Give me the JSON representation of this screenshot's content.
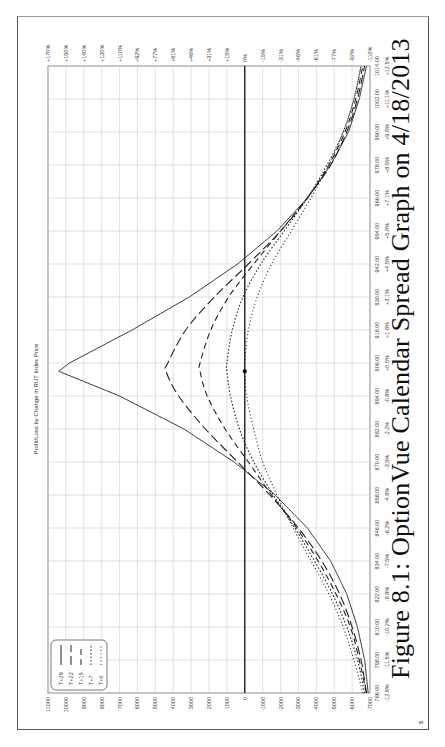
{
  "chart_data": {
    "type": "line",
    "title": "Profit/Loss by Change in RUT Index Price",
    "caption": "Figure 8.1: OptionVue Calendar Spread Graph on 4/18/2013",
    "xlabel": "RUT Index Price",
    "ylabel": "$",
    "x_ticks": [
      786,
      798,
      810,
      822,
      834,
      846,
      858,
      870,
      882,
      894,
      906,
      918,
      930,
      942,
      954,
      966,
      978,
      990,
      1002,
      1014
    ],
    "x_tick_labels": [
      "786.00",
      "798.00",
      "810.00",
      "822.00",
      "834.00",
      "846.00",
      "858.00",
      "870.00",
      "882.00",
      "894.00",
      "906.00",
      "918.00",
      "930.00",
      "942.00",
      "954.00",
      "966.00",
      "978.00",
      "990.00",
      "1002.00",
      "1014.00"
    ],
    "x_pct_labels": [
      "-12.8%",
      "-11.5%",
      "-10.2%",
      "-8.8%",
      "-7.5%",
      "-6.2%",
      "-4.8%",
      "-3.5%",
      "-2.2%",
      "-0.8%",
      "+0.5%",
      "+1.8%",
      "+3.1%",
      "+4.5%",
      "+5.8%",
      "+7.1%",
      "+8.5%",
      "+9.8%",
      "+11.1%",
      "+12.5%"
    ],
    "y_ticks": [
      11000,
      10000,
      9000,
      8000,
      7000,
      6000,
      5000,
      4000,
      3000,
      2000,
      1000,
      0,
      -1000,
      -2000,
      -3000,
      -4000,
      -5000,
      -6000,
      -7000
    ],
    "y_pct_labels": [
      "+170%",
      "+150%",
      "+140%",
      "+120%",
      "+110%",
      "+92%",
      "+77%",
      "+61%",
      "+46%",
      "+31%",
      "+15%",
      "0%",
      "-15%",
      "-31%",
      "-46%",
      "-61%",
      "-77%",
      "-92%",
      "-110%"
    ],
    "xlim": [
      786,
      1014
    ],
    "ylim": [
      -7000,
      11000
    ],
    "grid": true,
    "legend_position": "upper-left",
    "current_price": 903,
    "x": [
      786,
      798,
      810,
      822,
      834,
      846,
      858,
      870,
      882,
      894,
      903,
      906,
      918,
      930,
      942,
      954,
      966,
      978,
      990,
      1002,
      1014
    ],
    "series": [
      {
        "name": "T+29",
        "style": "solid",
        "values": [
          -6900,
          -6700,
          -6300,
          -5700,
          -4800,
          -3500,
          -1700,
          600,
          3400,
          7000,
          10400,
          9800,
          6300,
          3100,
          400,
          -1800,
          -3500,
          -4800,
          -5800,
          -6400,
          -6800
        ]
      },
      {
        "name": "T+22",
        "style": "dashed",
        "values": [
          -6800,
          -6500,
          -6000,
          -5300,
          -4300,
          -3000,
          -1400,
          400,
          2200,
          3700,
          4400,
          4300,
          3300,
          1700,
          -200,
          -2000,
          -3500,
          -4800,
          -5700,
          -6300,
          -6700
        ]
      },
      {
        "name": "T+15",
        "style": "dashed2",
        "values": [
          -6800,
          -6400,
          -5900,
          -5100,
          -4100,
          -2900,
          -1500,
          -200,
          1100,
          2100,
          2500,
          2500,
          1900,
          900,
          -500,
          -2000,
          -3500,
          -4700,
          -5600,
          -6200,
          -6600
        ]
      },
      {
        "name": "T+7",
        "style": "dotted",
        "values": [
          -6700,
          -6300,
          -5700,
          -4900,
          -3900,
          -2800,
          -1600,
          -500,
          300,
          800,
          1000,
          1000,
          700,
          100,
          -900,
          -2200,
          -3500,
          -4600,
          -5500,
          -6100,
          -6500
        ]
      },
      {
        "name": "T+0",
        "style": "dotted2",
        "values": [
          -6600,
          -6100,
          -5500,
          -4700,
          -3700,
          -2700,
          -1800,
          -1000,
          -500,
          -100,
          0,
          0,
          -200,
          -700,
          -1500,
          -2600,
          -3700,
          -4700,
          -5500,
          -6100,
          -6500
        ]
      }
    ]
  },
  "legend": {
    "items": [
      {
        "label": "T+29"
      },
      {
        "label": "T+22"
      },
      {
        "label": "T+15"
      },
      {
        "label": "T+7"
      },
      {
        "label": "T+0"
      }
    ]
  },
  "axis": {
    "unit_label": "$"
  }
}
